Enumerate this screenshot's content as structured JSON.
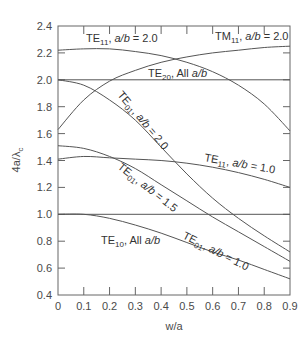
{
  "chart_data": {
    "type": "line",
    "title": "",
    "xlabel": "w/a",
    "ylabel": "4a/λc",
    "xlim": [
      0,
      0.9
    ],
    "ylim": [
      0.4,
      2.4
    ],
    "x_ticks": [
      "0",
      "0.1",
      "0.2",
      "0.3",
      "0.4",
      "0.5",
      "0.6",
      "0.7",
      "0.8",
      "0.9"
    ],
    "y_ticks": [
      "0.4",
      "0.6",
      "0.8",
      "1.0",
      "1.2",
      "1.4",
      "1.6",
      "1.8",
      "2.0",
      "2.2",
      "2.4"
    ],
    "grid": false,
    "legend": "inline labels",
    "series": [
      {
        "name": "TE11, a/b = 2.0",
        "x": [
          0,
          0.1,
          0.2,
          0.3,
          0.4,
          0.5,
          0.6,
          0.7,
          0.8,
          0.9
        ],
        "values": [
          2.22,
          2.23,
          2.23,
          2.21,
          2.18,
          2.13,
          2.06,
          1.96,
          1.82,
          1.62
        ]
      },
      {
        "name": "TM11, a/b = 2.0",
        "x": [
          0,
          0.1,
          0.2,
          0.3,
          0.4,
          0.5,
          0.6,
          0.7,
          0.8,
          0.9
        ],
        "values": [
          1.63,
          1.85,
          1.99,
          2.07,
          2.13,
          2.17,
          2.2,
          2.22,
          2.24,
          2.25
        ]
      },
      {
        "name": "TE20, All a/b",
        "x": [
          0,
          0.9
        ],
        "values": [
          2.0,
          2.0
        ]
      },
      {
        "name": "TE01, a/b = 2.0",
        "x": [
          0,
          0.1,
          0.2,
          0.3,
          0.4,
          0.5,
          0.6,
          0.7,
          0.8,
          0.9
        ],
        "values": [
          2.0,
          1.96,
          1.85,
          1.7,
          1.5,
          1.3,
          1.12,
          0.97,
          0.84,
          0.72
        ]
      },
      {
        "name": "TE11, a/b = 1.0",
        "x": [
          0,
          0.1,
          0.2,
          0.3,
          0.4,
          0.5,
          0.6,
          0.7,
          0.8,
          0.9
        ],
        "values": [
          1.41,
          1.43,
          1.42,
          1.41,
          1.4,
          1.38,
          1.35,
          1.31,
          1.26,
          1.2
        ]
      },
      {
        "name": "TE01, a/b = 1.5",
        "x": [
          0,
          0.1,
          0.2,
          0.3,
          0.4,
          0.5,
          0.6,
          0.7,
          0.8,
          0.9
        ],
        "values": [
          1.51,
          1.49,
          1.43,
          1.34,
          1.22,
          1.1,
          0.98,
          0.87,
          0.76,
          0.65
        ]
      },
      {
        "name": "TE10, All a/b",
        "x": [
          0,
          0.9
        ],
        "values": [
          1.0,
          1.0
        ]
      },
      {
        "name": "TE01, a/b = 1.0",
        "x": [
          0,
          0.1,
          0.2,
          0.3,
          0.4,
          0.5,
          0.6,
          0.7,
          0.8,
          0.9
        ],
        "values": [
          1.0,
          1.0,
          0.97,
          0.92,
          0.86,
          0.79,
          0.72,
          0.66,
          0.59,
          0.52
        ]
      }
    ],
    "annotations": [
      {
        "text": "TE11, a/b = 2.0",
        "main": "TE",
        "sub": "11",
        "rest": ", a/b = 2.0"
      },
      {
        "text": "TM11, a/b = 2.0",
        "main": "TM",
        "sub": "11",
        "rest": ", a/b = 2.0"
      },
      {
        "text": "TE20, All a/b",
        "main": "TE",
        "sub": "20",
        "rest": ", All a/b"
      },
      {
        "text": "TE01, a/b = 2.0",
        "main": "TE",
        "sub": "01",
        "rest": ", a/b = 2.0"
      },
      {
        "text": "TE11, a/b = 1.0",
        "main": "TE",
        "sub": "11",
        "rest": ", a/b = 1.0"
      },
      {
        "text": "TE01, a/b = 1.5",
        "main": "TE",
        "sub": "01",
        "rest": ", a/b = 1.5"
      },
      {
        "text": "TE10, All a/b",
        "main": "TE",
        "sub": "10",
        "rest": ", All a/b"
      },
      {
        "text": "TE01, a/b = 1.0",
        "main": "TE",
        "sub": "01",
        "rest": ", a/b = 1.0"
      }
    ]
  }
}
